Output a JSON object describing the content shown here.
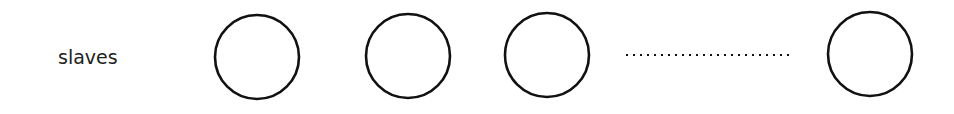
{
  "diagram": {
    "label": "slaves",
    "nodes": [
      {
        "id": "slave-1",
        "cx": 257,
        "cy": 57,
        "r": 42
      },
      {
        "id": "slave-2",
        "cx": 408,
        "cy": 56,
        "r": 42
      },
      {
        "id": "slave-3",
        "cx": 547,
        "cy": 55,
        "r": 42
      },
      {
        "id": "slave-n",
        "cx": 870,
        "cy": 54,
        "r": 42
      }
    ],
    "ellipsis": {
      "x1": 626,
      "x2": 790,
      "y": 55
    },
    "colors": {
      "stroke": "#111111",
      "text": "#222222",
      "background": "#ffffff"
    }
  }
}
